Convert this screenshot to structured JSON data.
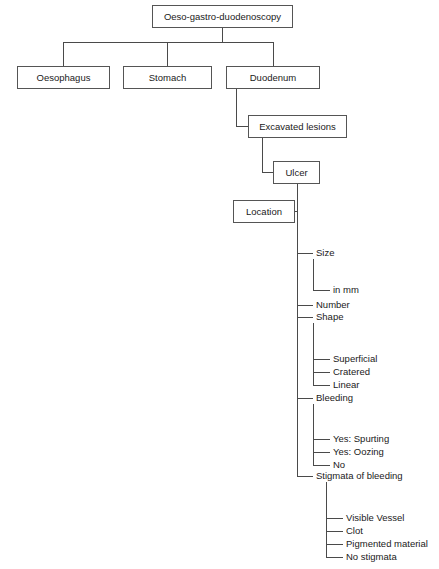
{
  "diagram": {
    "type": "flowchart-tree",
    "title": "Oeso-gastro-duodenoscopy",
    "root": {
      "label": "Oeso-gastro-duodenoscopy"
    },
    "organs": [
      {
        "label": "Oesophagus"
      },
      {
        "label": "Stomach"
      },
      {
        "label": "Duodenum"
      }
    ],
    "lesion": {
      "label": "Excavated lesions"
    },
    "ulcer": {
      "label": "Ulcer"
    },
    "location": {
      "label": "Location"
    },
    "attributes": [
      {
        "label": "Size"
      },
      {
        "label": "in mm"
      },
      {
        "label": "Number"
      },
      {
        "label": "Shape"
      },
      {
        "label": "Superficial"
      },
      {
        "label": "Cratered"
      },
      {
        "label": "Linear"
      },
      {
        "label": "Bleeding"
      },
      {
        "label": "Yes: Spurting"
      },
      {
        "label": "Yes: Oozing"
      },
      {
        "label": "No"
      },
      {
        "label": "Stigmata of bleeding"
      },
      {
        "label": "Visible Vessel"
      },
      {
        "label": "Clot"
      },
      {
        "label": "Pigmented material"
      },
      {
        "label": "No stigmata"
      }
    ],
    "colors": {
      "box_border": "#555555",
      "connector": "#4a4a4a",
      "text": "#1a1a1a",
      "background": "#ffffff"
    }
  }
}
